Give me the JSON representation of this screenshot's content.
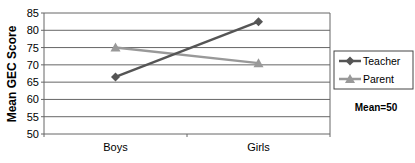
{
  "chart_data": {
    "type": "line",
    "title": "",
    "xlabel": "",
    "ylabel": "Mean GEC Score",
    "categories": [
      "Boys",
      "Girls"
    ],
    "ylim": [
      50,
      85
    ],
    "yticks": [
      50,
      55,
      60,
      65,
      70,
      75,
      80,
      85
    ],
    "grid": true,
    "legend_position": "right",
    "series": [
      {
        "name": "Teacher",
        "values": [
          66.5,
          82.5
        ],
        "color": "#555555",
        "marker": "diamond"
      },
      {
        "name": "Parent",
        "values": [
          75,
          70.5
        ],
        "color": "#999999",
        "marker": "triangle"
      }
    ],
    "annotations": [
      "Mean=50"
    ]
  }
}
